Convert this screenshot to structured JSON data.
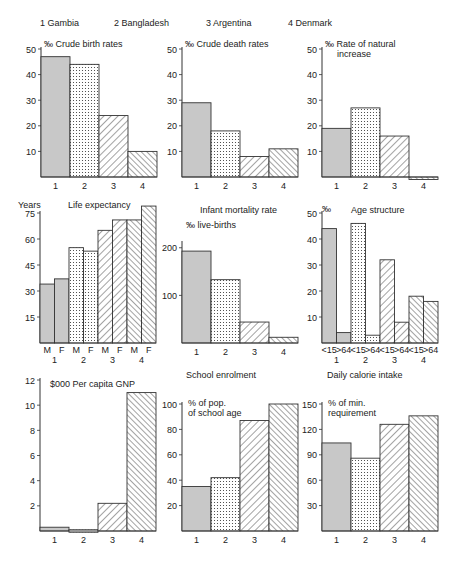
{
  "legend": [
    {
      "id": "1",
      "label": "1 Gambia"
    },
    {
      "id": "2",
      "label": "2 Bangladesh"
    },
    {
      "id": "3",
      "label": "3 Argentina"
    },
    {
      "id": "4",
      "label": "4 Denmark"
    }
  ],
  "patterns": {
    "1": "grey-solid",
    "2": "dotted",
    "3": "backslash-hatch",
    "4": "forward-hatch"
  },
  "colors": {
    "grey": "#c8c8c8",
    "ink": "#333333",
    "background": "#ffffff"
  },
  "chart_data": [
    {
      "type": "bar",
      "title": "Crude birth rates",
      "unit_label": "‰",
      "ylabel": "‰",
      "categories": [
        "1",
        "2",
        "3",
        "4"
      ],
      "values": [
        47,
        44,
        24,
        10
      ],
      "yticks": [
        10,
        20,
        30,
        40,
        50
      ],
      "ylim": [
        0,
        50
      ]
    },
    {
      "type": "bar",
      "title": "Crude death rates",
      "unit_label": "‰",
      "ylabel": "‰",
      "categories": [
        "1",
        "2",
        "3",
        "4"
      ],
      "values": [
        29,
        18,
        8,
        11
      ],
      "yticks": [
        10,
        20,
        30,
        40,
        50
      ],
      "ylim": [
        0,
        50
      ]
    },
    {
      "type": "bar",
      "title": "Rate of natural increase",
      "title_lines": [
        "Rate of natural",
        "increase"
      ],
      "unit_label": "‰",
      "ylabel": "‰",
      "categories": [
        "1",
        "2",
        "3",
        "4"
      ],
      "values": [
        19,
        27,
        16,
        -0.5
      ],
      "yticks": [
        10,
        20,
        30,
        40,
        50
      ],
      "ylim": [
        0,
        50
      ]
    },
    {
      "type": "bar",
      "title": "Life expectancy",
      "ylabel": "Years",
      "categories": [
        "M 1",
        "F 1",
        "M 2",
        "F 2",
        "M 3",
        "F 3",
        "M 4",
        "F 4"
      ],
      "sub_labels": [
        "M",
        "F",
        "M",
        "F",
        "M",
        "F",
        "M",
        "F"
      ],
      "group_labels": [
        "1",
        "2",
        "3",
        "4"
      ],
      "values": [
        34,
        37,
        55,
        53,
        65,
        71,
        71,
        79
      ],
      "yticks": [
        15,
        30,
        45,
        60,
        75
      ],
      "ylim": [
        0,
        75
      ]
    },
    {
      "type": "bar",
      "title": "Infant mortality rate",
      "ylabel": "‰ live-births",
      "categories": [
        "1",
        "2",
        "3",
        "4"
      ],
      "values": [
        193,
        133,
        44,
        12
      ],
      "yticks": [
        100,
        200
      ],
      "ylim": [
        0,
        210
      ]
    },
    {
      "type": "bar",
      "title": "Age structure",
      "ylabel": "%",
      "categories": [
        "<15 1",
        ">64 1",
        "<15 2",
        ">64 2",
        "<15 3",
        ">64 3",
        "<15 4",
        ">64 4"
      ],
      "sub_labels": [
        "<15",
        ">64",
        "<15",
        ">64",
        "<15",
        ">64",
        "<15",
        ">64"
      ],
      "group_labels": [
        "1",
        "2",
        "3",
        "4"
      ],
      "values": [
        44,
        4,
        46,
        3,
        32,
        8,
        18,
        16
      ],
      "yticks": [
        10,
        20,
        30,
        40,
        50
      ],
      "ylim": [
        0,
        50
      ]
    },
    {
      "type": "bar",
      "title": "Per capita GNP",
      "ylabel": "$000",
      "categories": [
        "1",
        "2",
        "3",
        "4"
      ],
      "values": [
        0.3,
        0.1,
        2.2,
        11
      ],
      "yticks": [
        2,
        4,
        6,
        8,
        10,
        12
      ],
      "ylim": [
        0,
        12
      ]
    },
    {
      "type": "bar",
      "title": "School enrolment",
      "ylabel": "% of pop. of school age",
      "ylabel_lines": [
        "% of pop.",
        "of school age"
      ],
      "categories": [
        "1",
        "2",
        "3",
        "4"
      ],
      "values": [
        35,
        42,
        87,
        100
      ],
      "yticks": [
        20,
        40,
        60,
        80,
        100
      ],
      "ylim": [
        0,
        100
      ]
    },
    {
      "type": "bar",
      "title": "Daily calorie intake",
      "ylabel": "% of min. requirement",
      "ylabel_lines": [
        "% of min.",
        "requirement"
      ],
      "categories": [
        "1",
        "2",
        "3",
        "4"
      ],
      "values": [
        104,
        86,
        126,
        136
      ],
      "yticks": [
        30,
        60,
        90,
        120,
        150
      ],
      "ylim": [
        0,
        150
      ]
    }
  ]
}
